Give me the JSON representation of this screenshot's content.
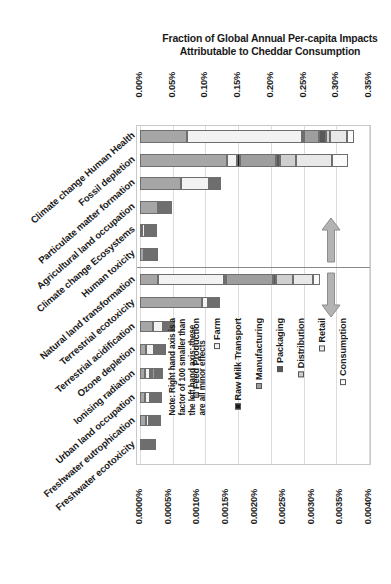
{
  "chart_data": {
    "type": "bar",
    "orientation": "horizontal-stacked",
    "title": "Fraction of Global Annual Per-capita Impacts Attributable to Cheddar Consumption",
    "title_line1": "Fraction of Global Annual Per-capita Impacts",
    "title_line2": "Attributable to Cheddar Consumption",
    "xlabel": "",
    "ylabel": "",
    "grid": true,
    "legend_position": "inside-bottom-right",
    "top_axis": {
      "name": "left hand axis",
      "ticks": [
        "0.00%",
        "0.05%",
        "0.10%",
        "0.15%",
        "0.20%",
        "0.25%",
        "0.30%",
        "0.35%"
      ],
      "values": [
        0.0,
        0.05,
        0.1,
        0.15,
        0.2,
        0.25,
        0.3,
        0.35
      ],
      "min": 0.0,
      "max": 0.35
    },
    "bottom_axis": {
      "name": "right hand axis",
      "ticks": [
        "0.0000%",
        "0.0005%",
        "0.0010%",
        "0.0015%",
        "0.0020%",
        "0.0025%",
        "0.0030%",
        "0.0035%",
        "0.0040%"
      ],
      "values": [
        0.0,
        0.0005,
        0.001,
        0.0015,
        0.002,
        0.0025,
        0.003,
        0.0035,
        0.004
      ],
      "min": 0.0,
      "max": 0.004
    },
    "series": [
      {
        "name": "Feed Production",
        "color": "#a6a6a6"
      },
      {
        "name": "Farm",
        "color": "#f2f2f2"
      },
      {
        "name": "Raw Milk Transport",
        "color": "#1a1a1a"
      },
      {
        "name": "Manufacturing",
        "color": "#9e9e9e"
      },
      {
        "name": "Packaging",
        "color": "#595959"
      },
      {
        "name": "Distribution",
        "color": "#cfcfcf"
      },
      {
        "name": "Retail",
        "color": "#e8e8e8"
      },
      {
        "name": "Consumption",
        "color": "#fafafa"
      }
    ],
    "categories": [
      "Climate change Human Health",
      "Fossil depletion",
      "Particulate matter formation",
      "Agricultural land occupation",
      "Climate change Ecosystems",
      "Human toxicity",
      "Natural land transformation",
      "Terrestrial ecotoxicity",
      "Terrestrial acidification",
      "Ozone depletion",
      "Ionising radiation",
      "Urban land occupation",
      "Freshwater eutrophication",
      "Freshwater ecotoxicity"
    ],
    "axis_assignment": [
      "top",
      "top",
      "top",
      "top",
      "top",
      "top",
      "bottom",
      "bottom",
      "bottom",
      "bottom",
      "bottom",
      "bottom",
      "bottom",
      "bottom"
    ],
    "rows": [
      {
        "category": "Climate change Human Health",
        "axis": "top",
        "total": 0.327,
        "values": [
          0.072,
          0.175,
          0.004,
          0.022,
          0.012,
          0.006,
          0.025,
          0.011
        ]
      },
      {
        "category": "Fossil depletion",
        "axis": "top",
        "total": 0.318,
        "values": [
          0.133,
          0.016,
          0.004,
          0.055,
          0.006,
          0.025,
          0.055,
          0.024
        ]
      },
      {
        "category": "Particulate matter formation",
        "axis": "top",
        "total": 0.12,
        "values": [
          0.062,
          0.043,
          0.002,
          0.004,
          0.003,
          0.002,
          0.003,
          0.001
        ]
      },
      {
        "category": "Agricultural land occupation",
        "axis": "top",
        "total": 0.03,
        "values": [
          0.027,
          0.002,
          0.0003,
          0.0003,
          0.0002,
          0.0001,
          0.0001,
          0.0001
        ]
      },
      {
        "category": "Climate change Ecosystems",
        "axis": "top",
        "total": 0.012,
        "values": [
          0.003,
          0.004,
          0.0005,
          0.002,
          0.0007,
          0.0005,
          0.001,
          0.0003
        ]
      },
      {
        "category": "Human toxicity",
        "axis": "top",
        "total": 0.009,
        "values": [
          0.006,
          0.001,
          0.0003,
          0.0005,
          0.0003,
          0.0002,
          0.0004,
          0.0002
        ]
      },
      {
        "category": "Natural land transformation",
        "axis": "bottom",
        "total": 0.00315,
        "values": [
          0.00032,
          0.00114,
          5e-05,
          0.00082,
          4e-05,
          0.0003,
          0.00036,
          0.00012
        ]
      },
      {
        "category": "Terrestrial ecotoxicity",
        "axis": "bottom",
        "total": 0.00128,
        "values": [
          0.00108,
          0.0001,
          2e-05,
          3e-05,
          1e-05,
          1e-05,
          2e-05,
          1e-05
        ]
      },
      {
        "category": "Terrestrial acidification",
        "axis": "bottom",
        "total": 0.0005,
        "values": [
          0.00022,
          0.00018,
          1e-05,
          3e-05,
          2e-05,
          1e-05,
          2e-05,
          1e-05
        ]
      },
      {
        "category": "Ozone depletion",
        "axis": "bottom",
        "total": 0.00036,
        "values": [
          0.0001,
          0.00014,
          1e-05,
          4e-05,
          2e-05,
          2e-05,
          2e-05,
          1e-05
        ]
      },
      {
        "category": "Ionising radiation",
        "axis": "bottom",
        "total": 0.00031,
        "values": [
          8e-05,
          9e-05,
          1e-05,
          6e-05,
          1e-05,
          3e-05,
          2e-05,
          1e-05
        ]
      },
      {
        "category": "Urban land occupation",
        "axis": "bottom",
        "total": 0.00027,
        "values": [
          9e-05,
          8e-05,
          1e-05,
          4e-05,
          1e-05,
          2e-05,
          1e-05,
          1e-05
        ]
      },
      {
        "category": "Freshwater eutrophication",
        "axis": "bottom",
        "total": 0.00024,
        "values": [
          0.0001,
          6e-05,
          1e-05,
          3e-05,
          1e-05,
          1e-05,
          1e-05,
          1e-05
        ]
      },
      {
        "category": "Freshwater ecotoxicity",
        "axis": "bottom",
        "total": 0.0001,
        "values": [
          4e-05,
          3e-05,
          5e-06,
          1e-05,
          5e-06,
          5e-06,
          5e-06,
          5e-06
        ]
      }
    ],
    "note": "Note: Right hand axis is a\nfactor of 100 smaller than\nthe left hand axis; these\nare all minor effects",
    "annotations": [
      {
        "name": "up-arrow",
        "meaning": "rows above use top (left hand) axis"
      },
      {
        "name": "down-arrow",
        "meaning": "rows below use bottom (right hand) axis"
      }
    ]
  }
}
